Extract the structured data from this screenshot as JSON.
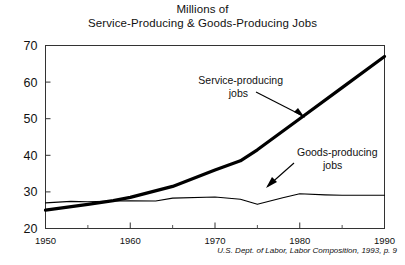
{
  "chart_data": {
    "type": "line",
    "title": "Millions of Service-Producing & Goods-Producing Jobs",
    "title_line1": "Millions of",
    "title_line2": "Service-Producing & Goods-Producing Jobs",
    "xlabel": "",
    "ylabel": "",
    "xlim": [
      1950,
      1990
    ],
    "ylim": [
      20,
      70
    ],
    "yticks": [
      20,
      30,
      40,
      50,
      60,
      70
    ],
    "ytick_labels": [
      "20",
      "30",
      "40",
      "50",
      "60",
      "70"
    ],
    "xticks": [
      1950,
      1960,
      1970,
      1980,
      1990
    ],
    "xtick_labels": [
      "1950",
      "1960",
      "1970",
      "1980",
      "1990"
    ],
    "x_minor_ticks": [
      1955,
      1965,
      1975,
      1985
    ],
    "grid": false,
    "legend": "none",
    "frame": true,
    "series": [
      {
        "name": "Service-producing jobs",
        "style": "thick",
        "color": "#000000",
        "x": [
          1950,
          1955,
          1958,
          1960,
          1965,
          1970,
          1973,
          1975,
          1980,
          1985,
          1990
        ],
        "values": [
          25.0,
          26.6,
          27.6,
          28.5,
          31.5,
          36.0,
          38.5,
          41.5,
          50.0,
          58.5,
          67.0
        ]
      },
      {
        "name": "Goods-producing jobs",
        "style": "thin",
        "color": "#000000",
        "x": [
          1950,
          1953,
          1955,
          1958,
          1960,
          1963,
          1965,
          1970,
          1973,
          1975,
          1978,
          1980,
          1983,
          1985,
          1990
        ],
        "values": [
          27.0,
          27.4,
          27.3,
          27.5,
          27.6,
          27.5,
          28.3,
          28.6,
          28.0,
          26.6,
          28.4,
          29.5,
          29.2,
          29.1,
          29.1
        ]
      }
    ],
    "annotations": [
      {
        "label_line1": "Service-producing",
        "label_line2": "jobs",
        "text": "Service-producing jobs",
        "target_x": 1980,
        "target_y": 50
      },
      {
        "label_line1": "Goods-producing",
        "label_line2": "jobs",
        "text": "Goods-producing jobs",
        "target_x": 1980,
        "target_y": 29.5
      }
    ],
    "source": "U.S. Dept. of Labor, Labor Composition, 1993, p. 9"
  }
}
